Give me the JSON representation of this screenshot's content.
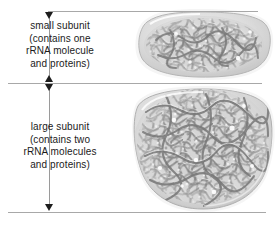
{
  "figure": {
    "background_color": "#ffffff"
  },
  "annotations": {
    "small_subunit": {
      "lines": [
        "small subunit",
        "(contains one",
        "rRNA molecule",
        "and proteins)"
      ]
    },
    "large_subunit": {
      "lines": [
        "large subunit",
        "(contains two",
        "rRNA molecules",
        "and proteins)"
      ]
    }
  },
  "colors": {
    "text": "#1b1b1b",
    "arrow": "#1d1d1d",
    "leader_line": "#a8a8a8",
    "stem_line": "#9a9a9a",
    "subunit_fill_light": "#e9e9e9",
    "subunit_fill_mid": "#c9c9c9",
    "rna_strand": "#8e8e8e",
    "rna_strand_dark": "#6e6e6e"
  },
  "diagram_elements": [
    {
      "name": "small-subunit-body",
      "shape": "rounded-ellipse",
      "description": "upper smaller lobe of the ribosome containing coiled rRNA strands"
    },
    {
      "name": "large-subunit-body",
      "shape": "rounded-dome",
      "description": "lower larger lobe of the ribosome containing coiled rRNA strands"
    }
  ]
}
